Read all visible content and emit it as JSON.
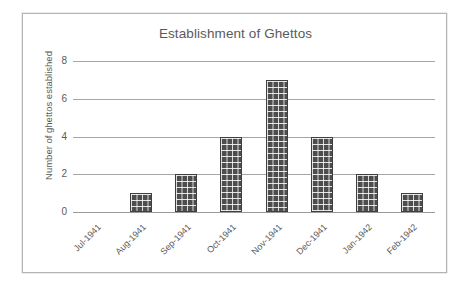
{
  "chart_data": {
    "type": "bar",
    "title": "Establishment of Ghettos",
    "xlabel": "",
    "ylabel": "Number of ghettos established",
    "categories": [
      "Jul-1941",
      "Aug-1941",
      "Sep-1941",
      "Oct-1941",
      "Nov-1941",
      "Dec-1941",
      "Jan-1942",
      "Feb-1942"
    ],
    "values": [
      0,
      1,
      2,
      4,
      7,
      4,
      2,
      1
    ],
    "yticks": [
      0,
      2,
      4,
      6,
      8
    ],
    "ylim": [
      0,
      8
    ],
    "grid": true,
    "legend": false,
    "legend_position": "none",
    "bar_fill": "brick-pattern",
    "bar_color": "#4d4d4d",
    "text_color": "#5a5a5a",
    "gridline_color": "#a6a6a6",
    "frame_color": "#b4b4b4",
    "background": "#ffffff"
  }
}
